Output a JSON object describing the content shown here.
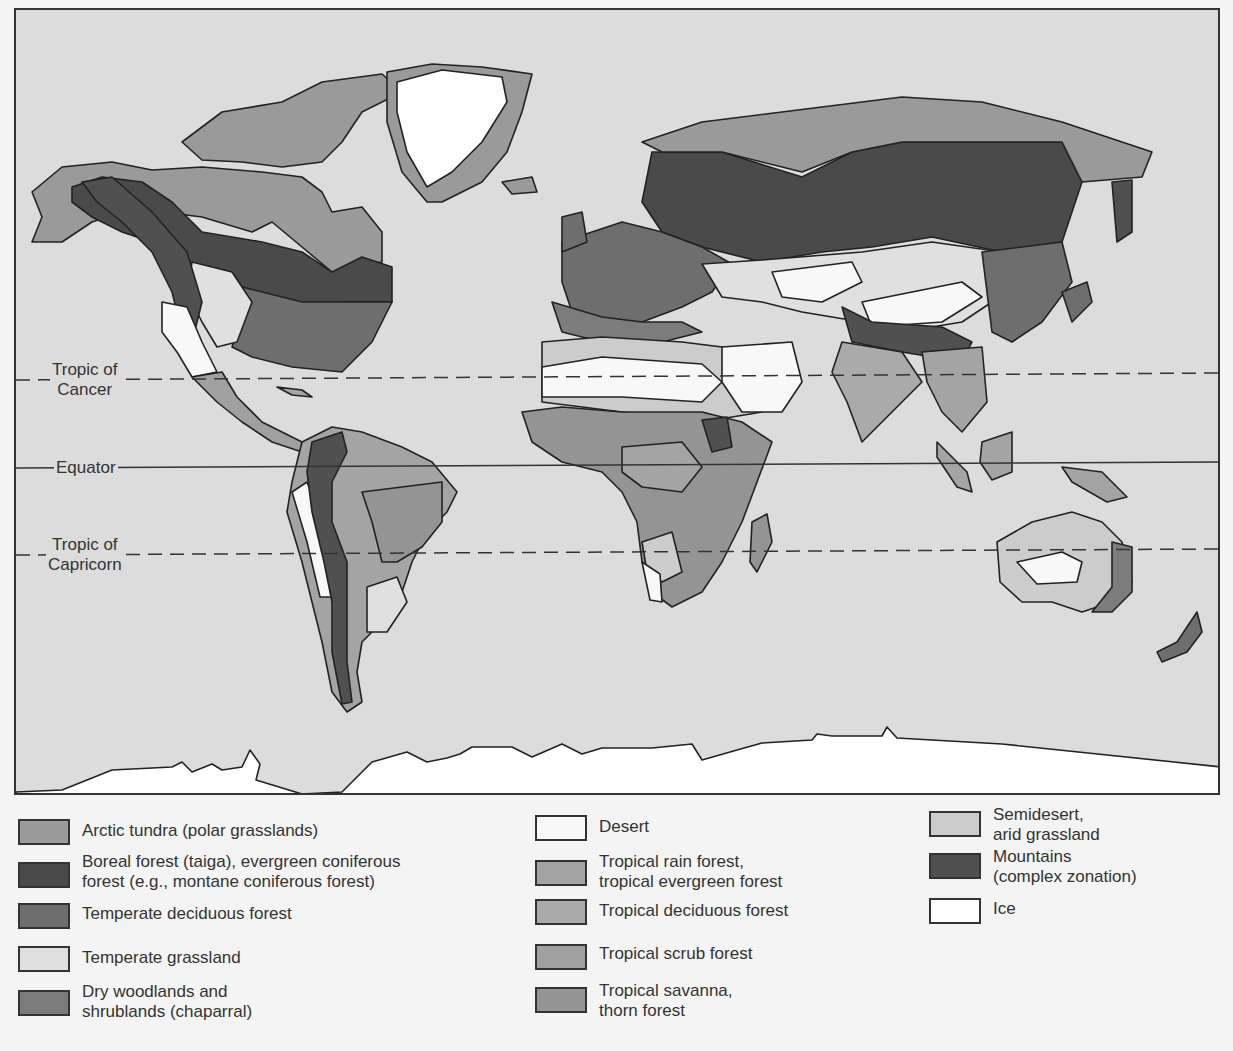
{
  "map": {
    "title": "World biomes",
    "ocean_color": "#dcdcdc",
    "reference_lines": [
      {
        "id": "tropic-of-cancer",
        "label": "Tropic of\nCancer",
        "style": "dashed"
      },
      {
        "id": "equator",
        "label": "Equator",
        "style": "solid"
      },
      {
        "id": "tropic-of-capricorn",
        "label": "Tropic of\nCapricorn",
        "style": "dashed"
      }
    ],
    "lat_labels": {
      "cancer": "Tropic of\nCancer",
      "equator": "Equator",
      "capricorn": "Tropic of\nCapricorn"
    }
  },
  "legend": {
    "items": [
      {
        "key": "arctic-tundra",
        "label": "Arctic tundra (polar grasslands)",
        "color": "#9a9a9a"
      },
      {
        "key": "boreal-forest",
        "label": "Boreal forest (taiga), evergreen coniferous\nforest (e.g., montane coniferous forest)",
        "color": "#4a4a4a"
      },
      {
        "key": "temperate-deciduous-forest",
        "label": "Temperate deciduous forest",
        "color": "#6e6e6e"
      },
      {
        "key": "temperate-grassland",
        "label": "Temperate grassland",
        "color": "#e0e0e0"
      },
      {
        "key": "dry-woodlands",
        "label": "Dry woodlands and\nshrublands (chaparral)",
        "color": "#7c7c7c"
      },
      {
        "key": "desert",
        "label": "Desert",
        "color": "#f8f8f8"
      },
      {
        "key": "tropical-rain-forest",
        "label": "Tropical rain forest,\ntropical evergreen forest",
        "color": "#a4a4a4"
      },
      {
        "key": "tropical-deciduous-forest",
        "label": "Tropical deciduous forest",
        "color": "#aaaaaa"
      },
      {
        "key": "tropical-scrub-forest",
        "label": "Tropical scrub forest",
        "color": "#a0a0a0"
      },
      {
        "key": "tropical-savanna",
        "label": "Tropical savanna,\nthorn forest",
        "color": "#949494"
      },
      {
        "key": "semidesert",
        "label": "Semidesert,\narid grassland",
        "color": "#cccccc"
      },
      {
        "key": "mountains",
        "label": "Mountains\n(complex zonation)",
        "color": "#505050"
      },
      {
        "key": "ice",
        "label": "Ice",
        "color": "#ffffff"
      }
    ]
  }
}
